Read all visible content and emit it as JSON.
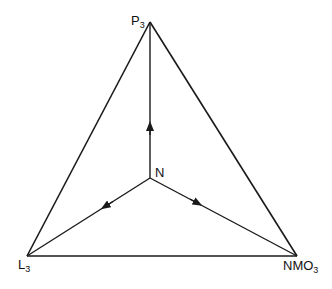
{
  "diagram": {
    "type": "ternary-triangle",
    "vertices": {
      "top": {
        "label": "P",
        "subscript": "3"
      },
      "bottom_left": {
        "label": "L",
        "subscript": "3"
      },
      "bottom_right": {
        "label": "NMO",
        "subscript": "3"
      }
    },
    "center": {
      "label": "N"
    },
    "arrows": [
      {
        "from": "N",
        "toward": "P3"
      },
      {
        "from": "N",
        "toward": "L3"
      },
      {
        "from": "N",
        "toward": "NMO3"
      }
    ],
    "colors": {
      "line": "#1a1a1a",
      "background": "#ffffff"
    }
  }
}
